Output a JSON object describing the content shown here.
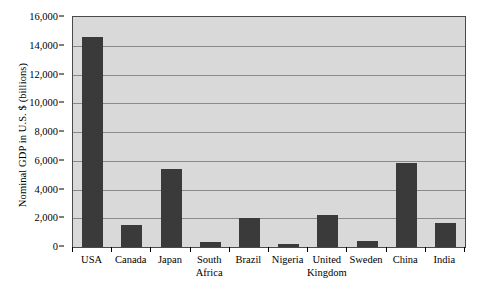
{
  "chart_data": {
    "type": "bar",
    "title": "",
    "subtitle": "",
    "xlabel": "",
    "ylabel": "Nominal GDP in U.S. $ (billions)",
    "categories": [
      "USA",
      "Canada",
      "Japan",
      "South Africa",
      "Brazil",
      "Nigeria",
      "United Kingdom",
      "Sweden",
      "China",
      "India"
    ],
    "values": [
      14580,
      1530,
      5430,
      370,
      2000,
      200,
      2200,
      450,
      5840,
      1640
    ],
    "ylim": [
      0,
      16000
    ],
    "yticks": [
      0,
      2000,
      4000,
      6000,
      8000,
      10000,
      12000,
      14000,
      16000
    ],
    "ytick_labels": [
      "0",
      "2,000",
      "4,000",
      "6,000",
      "8,000",
      "10,000",
      "12,000",
      "14,000",
      "16,000"
    ],
    "grid": true,
    "grid_axis": "y",
    "legend": false,
    "legend_position": "none",
    "bar_color": "#3a3a3a",
    "plot_background": "#d9d9d9",
    "gridline_color": "#8a8a8a",
    "axis_color": "#4a4a4a",
    "category_label_lines": [
      [
        "USA"
      ],
      [
        "Canada"
      ],
      [
        "Japan"
      ],
      [
        "South",
        "Africa"
      ],
      [
        "Brazil"
      ],
      [
        "Nigeria"
      ],
      [
        "United",
        "Kingdom"
      ],
      [
        "Sweden"
      ],
      [
        "China"
      ],
      [
        "India"
      ]
    ]
  }
}
